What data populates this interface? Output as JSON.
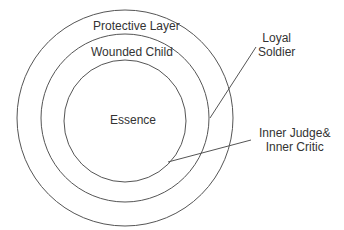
{
  "diagram": {
    "layers": [
      {
        "label": "Protective Layer",
        "ring": "outer"
      },
      {
        "label": "Wounded Child",
        "ring": "middle"
      },
      {
        "label": "Essence",
        "ring": "inner"
      }
    ],
    "callouts": [
      {
        "label_line1": "Loyal",
        "label_line2": "Soldier",
        "points_to": "between outer and middle ring"
      },
      {
        "label_line1": "Inner Judge&",
        "label_line2": "Inner Critic",
        "points_to": "inner ring"
      }
    ],
    "colors": {
      "stroke": "#555555",
      "text": "#333333"
    }
  }
}
